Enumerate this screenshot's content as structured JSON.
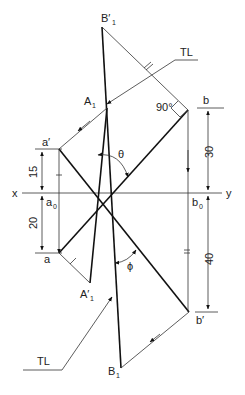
{
  "diagram": {
    "type": "orthographic-projection-true-length",
    "points": {
      "B1_prime": {
        "label": "B′",
        "sub": "1"
      },
      "A1": {
        "label": "A",
        "sub": "1"
      },
      "a_prime": {
        "label": "a′"
      },
      "a0": {
        "label": "a",
        "sub": "0"
      },
      "a": {
        "label": "a"
      },
      "A1_prime": {
        "label": "A′",
        "sub": "1"
      },
      "b": {
        "label": "b"
      },
      "b0": {
        "label": "b",
        "sub": "0"
      },
      "b_prime": {
        "label": "b′"
      },
      "B1": {
        "label": "B",
        "sub": "1"
      }
    },
    "axis": {
      "left": "x",
      "right": "y"
    },
    "annotations": {
      "tl_top": "TL",
      "tl_bottom": "TL",
      "right_angle": "90°",
      "theta": "θ",
      "phi": "ϕ"
    },
    "dimensions": {
      "a_prime_above_xy": "15",
      "a_below_xy": "20",
      "b_above_xy": "30",
      "b_prime_below_xy": "40"
    },
    "caption": ""
  }
}
